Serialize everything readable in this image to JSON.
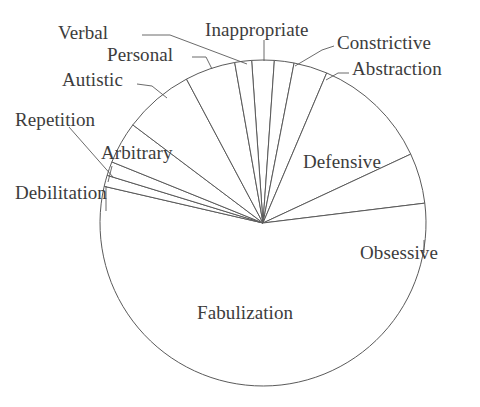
{
  "chart_data": {
    "type": "pie",
    "title": "",
    "subtitle": "",
    "xlabel": "",
    "ylabel": "",
    "legend_position": "none",
    "grid": false,
    "center_x": 263,
    "center_y": 223,
    "radius": 163,
    "start_angle_deg": -90,
    "direction": "clockwise",
    "categories": [
      "Inappropriate",
      "Constrictive",
      "Abstraction",
      "Defensive",
      "Obsessive",
      "Fabulization",
      "Debilitation",
      "Repetition",
      "Arbitrary",
      "Autistic",
      "Personal",
      "Verbal"
    ],
    "values": [
      2.2,
      1.9,
      3.3,
      11.7,
      5.0,
      55.6,
      1.1,
      1.4,
      4.2,
      6.9,
      5.0,
      1.7
    ],
    "angles_deg": [
      8,
      7,
      12,
      42,
      18,
      200,
      4,
      5,
      15,
      25,
      18,
      6
    ],
    "slices": [
      {
        "label": "Inappropriate",
        "value": 2.2,
        "angle_deg": 8,
        "start_deg": -94,
        "end_deg": -86,
        "label_placement": "outside"
      },
      {
        "label": "Constrictive",
        "value": 1.9,
        "angle_deg": 7,
        "start_deg": -86,
        "end_deg": -79,
        "label_placement": "outside"
      },
      {
        "label": "Abstraction",
        "value": 3.3,
        "angle_deg": 12,
        "start_deg": -79,
        "end_deg": -67,
        "label_placement": "outside"
      },
      {
        "label": "Defensive",
        "value": 11.7,
        "angle_deg": 42,
        "start_deg": -67,
        "end_deg": -25,
        "label_placement": "inside"
      },
      {
        "label": "Obsessive",
        "value": 5.0,
        "angle_deg": 18,
        "start_deg": -25,
        "end_deg": -7,
        "label_placement": "outside"
      },
      {
        "label": "Fabulization",
        "value": 55.6,
        "angle_deg": 200,
        "start_deg": -7,
        "end_deg": 193,
        "label_placement": "inside"
      },
      {
        "label": "Debilitation",
        "value": 1.1,
        "angle_deg": 4,
        "start_deg": 193,
        "end_deg": 197,
        "label_placement": "outside"
      },
      {
        "label": "Repetition",
        "value": 1.4,
        "angle_deg": 5,
        "start_deg": 197,
        "end_deg": 202,
        "label_placement": "outside"
      },
      {
        "label": "Arbitrary",
        "value": 4.2,
        "angle_deg": 15,
        "start_deg": 202,
        "end_deg": 217,
        "label_placement": "outside"
      },
      {
        "label": "Autistic",
        "value": 6.9,
        "angle_deg": 25,
        "start_deg": 217,
        "end_deg": 242,
        "label_placement": "outside"
      },
      {
        "label": "Personal",
        "value": 5.0,
        "angle_deg": 18,
        "start_deg": 242,
        "end_deg": 260,
        "label_placement": "outside"
      },
      {
        "label": "Verbal",
        "value": 1.7,
        "angle_deg": 6,
        "start_deg": 260,
        "end_deg": 266,
        "label_placement": "outside"
      }
    ],
    "colors": {
      "slice_fill": "#ffffff",
      "slice_stroke": "#5a5a5a",
      "leader_line": "#5a5a5a",
      "label_text": "#3c3c3c",
      "background": "#ffffff"
    }
  },
  "labels": {
    "verbal": "Verbal",
    "inappropriate": "Inappropriate",
    "constrictive": "Constrictive",
    "personal": "Personal",
    "abstraction": "Abstraction",
    "autistic": "Autistic",
    "repetition": "Repetition",
    "arbitrary": "Arbitrary",
    "debilitation": "Debilitation",
    "defensive": "Defensive",
    "obsessive": "Obsessive",
    "fabulization": "Fabulization"
  }
}
